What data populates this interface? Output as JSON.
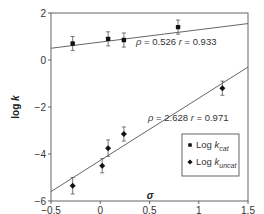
{
  "chart_data": {
    "type": "scatter",
    "title": "",
    "xlabel": "σ",
    "ylabel": "log k",
    "xlim": [
      -0.5,
      1.5
    ],
    "ylim": [
      -6,
      2
    ],
    "xticks": [
      -0.5,
      0,
      0.5,
      1,
      1.5
    ],
    "xtick_labels": [
      "−0.5",
      "0",
      "0.5",
      "1",
      "1.5"
    ],
    "yticks": [
      -6,
      -4,
      -2,
      0,
      2
    ],
    "ytick_labels": [
      "−6",
      "−4",
      "−2",
      "0",
      "2"
    ],
    "grid": false,
    "legend_position": "lower right",
    "series": [
      {
        "name": "Log kcat",
        "label_main": "Log k",
        "label_sub": "cat",
        "marker": "circle",
        "x": [
          -0.28,
          0.08,
          0.24,
          0.79
        ],
        "y": [
          0.7,
          0.9,
          0.85,
          1.4
        ],
        "error": [
          0.3,
          0.3,
          0.3,
          0.3
        ],
        "fit": {
          "x": [
            -0.5,
            1.5
          ],
          "y": [
            0.5,
            1.55
          ],
          "rho": "0.526",
          "r": "0.933"
        }
      },
      {
        "name": "Log kuncat",
        "label_main": "Log k",
        "label_sub": "uncat",
        "marker": "diamond",
        "x": [
          -0.28,
          0.02,
          0.08,
          0.24,
          1.24
        ],
        "y": [
          -5.35,
          -4.5,
          -3.75,
          -3.15,
          -1.2
        ],
        "error": [
          0.35,
          0.3,
          0.35,
          0.3,
          0.3
        ],
        "fit": {
          "x": [
            -0.5,
            1.5
          ],
          "y": [
            -5.6,
            -0.3
          ],
          "rho": "2.628",
          "r": "0.971"
        }
      }
    ],
    "annotations": [
      {
        "text_rho": "ρ = 0.526",
        "text_r": "r = 0.933",
        "x": 0.37,
        "y": 0.3
      },
      {
        "text_rho": "ρ = 2.628",
        "text_r": "r = 0.971",
        "x": 0.5,
        "y": -2.1
      }
    ]
  }
}
